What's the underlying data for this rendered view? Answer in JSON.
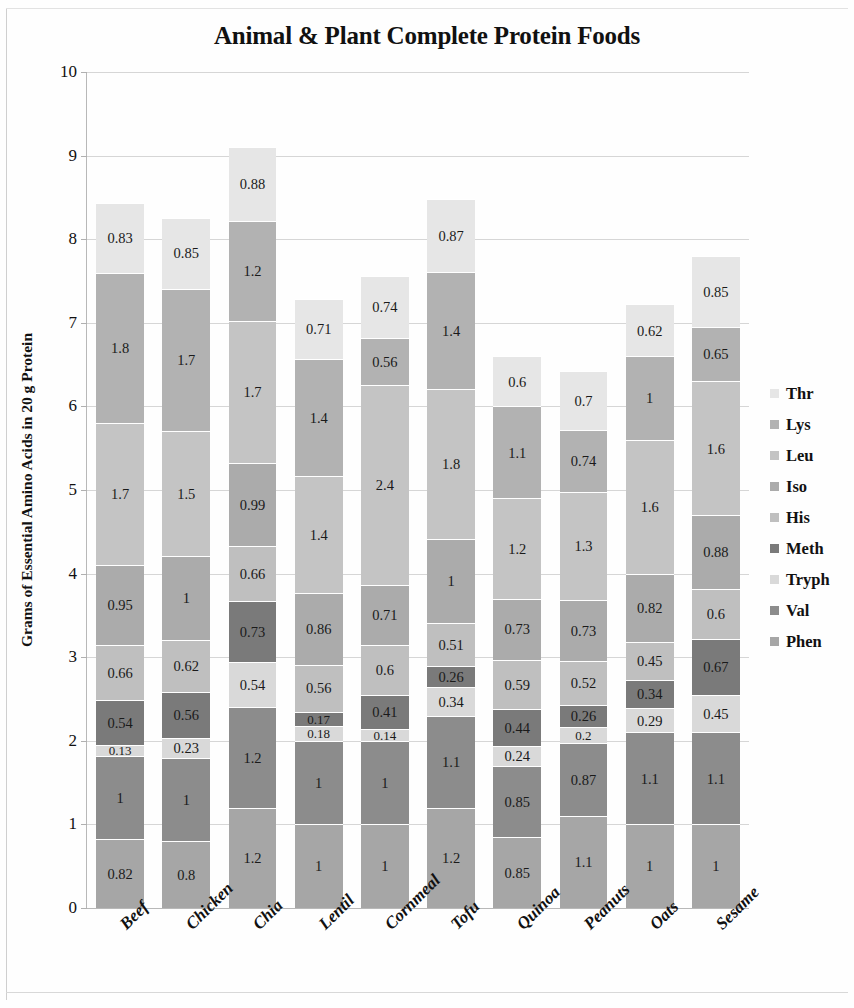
{
  "chart_data": {
    "type": "bar",
    "subtype": "stacked-bar",
    "title": "Animal & Plant Complete Protein Foods",
    "xlabel": "",
    "ylabel": "Grams of Essential Amino Acids in 20 g Protein",
    "ylim": [
      0,
      10
    ],
    "yticks": [
      0,
      1,
      2,
      3,
      4,
      5,
      6,
      7,
      8,
      9,
      10
    ],
    "ytick_labels": [
      "0",
      "1",
      "2",
      "3",
      "4",
      "5",
      "6",
      "7",
      "8",
      "9",
      "10"
    ],
    "grid": true,
    "legend_position": "right",
    "categories": [
      "Beef",
      "Chicken",
      "Chia",
      "Lentil",
      "Cornmeal",
      "Tofu",
      "Quinoa",
      "Peanuts",
      "Oats",
      "Sesame"
    ],
    "series": [
      {
        "name": "Phen",
        "color": "#a6a6a6",
        "values": [
          0.82,
          0.8,
          1.2,
          1,
          1,
          1.2,
          0.85,
          1.1,
          1,
          1
        ]
      },
      {
        "name": "Val",
        "color": "#8c8c8c",
        "values": [
          1,
          1,
          1.2,
          1,
          1,
          1.1,
          0.85,
          0.87,
          1.1,
          1.1
        ]
      },
      {
        "name": "Tryph",
        "color": "#d9d9d9",
        "values": [
          0.13,
          0.23,
          0.54,
          0.18,
          0.14,
          0.34,
          0.24,
          0.2,
          0.29,
          0.45
        ]
      },
      {
        "name": "Meth",
        "color": "#7a7a7a",
        "values": [
          0.54,
          0.56,
          0.73,
          0.17,
          0.41,
          0.26,
          0.44,
          0.26,
          0.34,
          0.67
        ]
      },
      {
        "name": "His",
        "color": "#bfbfbf",
        "values": [
          0.66,
          0.62,
          0.66,
          0.56,
          0.6,
          0.51,
          0.59,
          0.52,
          0.45,
          0.6
        ]
      },
      {
        "name": "Iso",
        "color": "#ababab",
        "values": [
          0.95,
          1,
          0.99,
          0.86,
          0.71,
          1,
          0.73,
          0.73,
          0.82,
          0.88
        ]
      },
      {
        "name": "Leu",
        "color": "#c4c4c4",
        "values": [
          1.7,
          1.5,
          1.7,
          1.4,
          2.4,
          1.8,
          1.2,
          1.3,
          1.6,
          1.6
        ]
      },
      {
        "name": "Lys",
        "color": "#b2b2b2",
        "values": [
          1.8,
          1.7,
          1.2,
          1.4,
          0.56,
          1.4,
          1.1,
          0.74,
          1,
          0.65
        ]
      },
      {
        "name": "Thr",
        "color": "#e6e6e6",
        "values": [
          0.83,
          0.85,
          0.88,
          0.71,
          0.74,
          0.87,
          0.6,
          0.7,
          0.62,
          0.85
        ]
      }
    ],
    "totals": [
      8.43,
      8.26,
      9.1,
      7.28,
      7.56,
      8.48,
      6.6,
      6.42,
      7.22,
      7.8
    ]
  },
  "legend": {
    "items": [
      {
        "label": "Thr",
        "color": "#e6e6e6"
      },
      {
        "label": "Lys",
        "color": "#b2b2b2"
      },
      {
        "label": "Leu",
        "color": "#c4c4c4"
      },
      {
        "label": "Iso",
        "color": "#ababab"
      },
      {
        "label": "His",
        "color": "#bfbfbf"
      },
      {
        "label": "Meth",
        "color": "#7a7a7a"
      },
      {
        "label": "Tryph",
        "color": "#d9d9d9"
      },
      {
        "label": "Val",
        "color": "#8c8c8c"
      },
      {
        "label": "Phen",
        "color": "#a6a6a6"
      }
    ]
  }
}
